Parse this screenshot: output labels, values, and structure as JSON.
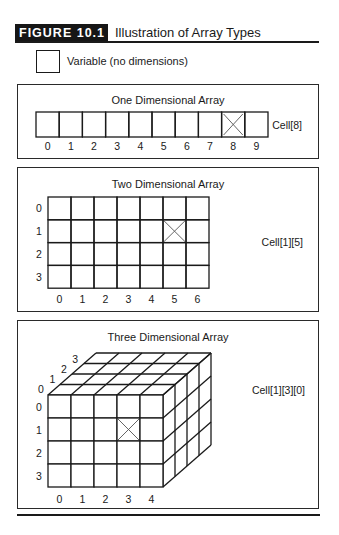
{
  "figure": {
    "label": "FIGURE 10.1",
    "title": "Illustration of Array Types"
  },
  "legend": {
    "variable_label": "Variable (no dimensions)"
  },
  "one_d": {
    "title": "One Dimensional Array",
    "cells": 10,
    "indices": [
      "0",
      "1",
      "2",
      "3",
      "4",
      "5",
      "6",
      "7",
      "8",
      "9"
    ],
    "marked_cell": 8,
    "cell_label": "Cell[8]"
  },
  "two_d": {
    "title": "Two Dimensional Array",
    "rows": 4,
    "cols": 7,
    "row_indices": [
      "0",
      "1",
      "2",
      "3"
    ],
    "col_indices": [
      "0",
      "1",
      "2",
      "3",
      "4",
      "5",
      "6"
    ],
    "marked_row": 1,
    "marked_col": 5,
    "cell_label": "Cell[1][5]"
  },
  "three_d": {
    "title": "Three Dimensional Array",
    "rows": 4,
    "cols": 5,
    "depth": 4,
    "row_indices": [
      "0",
      "1",
      "2",
      "3"
    ],
    "col_indices": [
      "0",
      "1",
      "2",
      "3",
      "4"
    ],
    "depth_indices": [
      "0",
      "1",
      "2",
      "3"
    ],
    "marked_row": 1,
    "marked_col": 3,
    "marked_depth": 0,
    "cell_label": "Cell[1][3][0]"
  },
  "colors": {
    "ink": "#1a1a1a",
    "label_bg": "#161616",
    "label_text": "#ffffff",
    "marker": "#555555"
  }
}
